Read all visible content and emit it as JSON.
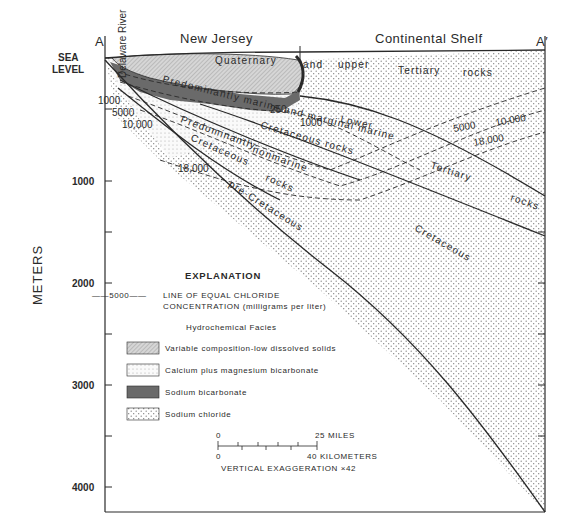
{
  "section": {
    "left_end": "A",
    "right_end": "A′",
    "landmark": "Delaware River",
    "regions": [
      "New Jersey",
      "Continental Shelf"
    ],
    "sea_level_label": [
      "SEA",
      "LEVEL"
    ]
  },
  "depth_axis": {
    "title": "METERS",
    "ticks": [
      "1000",
      "2000",
      "3000",
      "4000"
    ]
  },
  "units": {
    "quaternary": "Quaternary",
    "and": "and",
    "upper": "upper",
    "tertiary_rocks_top": [
      "Tertiary",
      "rocks"
    ],
    "pred_marine": "Predominantly marine and marginal marine",
    "cret_rocks_upper": "Cretaceous rocks",
    "lower": "Lower",
    "tertiary": "Tertiary",
    "rocks": "rocks",
    "pred_nonmarine": [
      "Predominantly",
      "nonmarine"
    ],
    "cret_lower": [
      "Cretaceous",
      "rocks"
    ],
    "pre_cretaceous": "pre-Cretaceous",
    "cretaceous": "Cretaceous"
  },
  "isochlors": {
    "left": [
      "1000",
      "5000",
      "10,000"
    ],
    "mid": [
      "250",
      "1000"
    ],
    "cret": "18,000",
    "right": [
      "5000",
      "10,000",
      "18,000"
    ]
  },
  "explanation": {
    "title": "EXPLANATION",
    "line_sample": "——5000——",
    "line_desc": [
      "LINE OF EQUAL CHLORIDE",
      "CONCENTRATION (milligrams per liter)"
    ],
    "facies_title": "Hydrochemical Facies",
    "facies": [
      {
        "pattern": "diagonal-hatch",
        "label": "Variable composition-low dissolved solids"
      },
      {
        "pattern": "fine-dots",
        "label": "Calcium plus magnesium bicarbonate"
      },
      {
        "pattern": "dark-solid",
        "label": "Sodium bicarbonate"
      },
      {
        "pattern": "coarse-dots",
        "label": "Sodium chloride"
      }
    ]
  },
  "scale": {
    "zero_top": "0",
    "miles": "25 MILES",
    "zero_bottom": "0",
    "km": "40 KILOMETERS",
    "exaggeration": "VERTICAL EXAGGERATION ×42"
  },
  "colors": {
    "line": "#2a2a2a",
    "hatch": "#c8c8c8",
    "dark_facies": "#6a6a6a",
    "dots": "#8a8a8a"
  }
}
